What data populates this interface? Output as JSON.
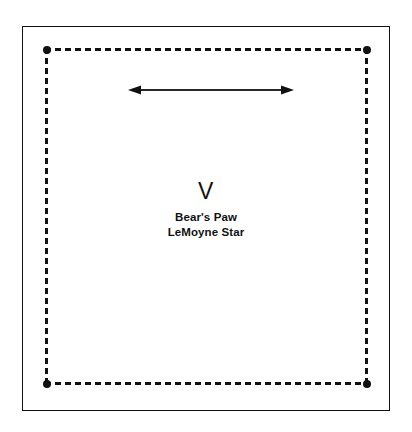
{
  "figure": {
    "background_color": "#ffffff",
    "ink_color": "#111111",
    "outer_frame": {
      "name": "page-border",
      "style": "solid"
    },
    "dashed_block": {
      "name": "quilt-block-boundary",
      "style": "dashed",
      "corner_marker": "filled-dot",
      "corner_count": 4
    },
    "dimension_arrow": {
      "name": "width-dimension-arrow",
      "orientation": "horizontal",
      "heads": "double"
    },
    "labels": {
      "numeral": "V",
      "pattern_names": [
        "Bear's Paw",
        "LeMoyne Star"
      ]
    }
  }
}
